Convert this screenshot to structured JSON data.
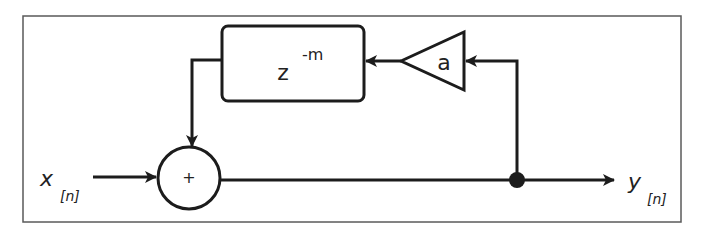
{
  "diagram": {
    "type": "signal-flow block diagram (feedback comb filter)",
    "input": {
      "label": "x",
      "subscript": "[n]"
    },
    "output": {
      "label": "y",
      "subscript": "[n]"
    },
    "summing_junction": {
      "symbol": "+"
    },
    "delay_block": {
      "base": "z",
      "exponent": "-m"
    },
    "gain_block": {
      "label": "a"
    },
    "colors": {
      "stroke": "#1c1c1c",
      "frame": "#5a5a5a",
      "background": "#ffffff",
      "text": "#222222"
    }
  }
}
